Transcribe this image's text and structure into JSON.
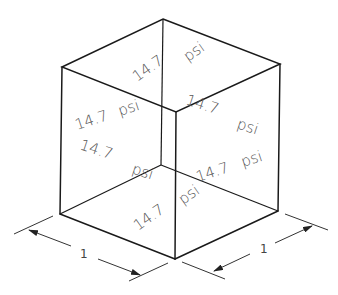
{
  "diagram": {
    "title": "",
    "type": "isometric-cube-pressure",
    "colors": {
      "line": "#1a1a1a",
      "label": "#555555"
    },
    "faces": {
      "top": {
        "value": "14.7",
        "unit": "psi"
      },
      "left_upper": {
        "value": "14.7",
        "unit": "psi"
      },
      "left_lower_value": "14.7",
      "left_lower_unit": "psi",
      "right_upper_value": "14.7",
      "right_upper_unit": "psi",
      "right_lower": {
        "value": "14.7",
        "unit": "psi"
      },
      "bottom": {
        "value": "14.7",
        "unit": "psi"
      }
    },
    "dimensions": {
      "left": "1",
      "right": "1"
    }
  }
}
